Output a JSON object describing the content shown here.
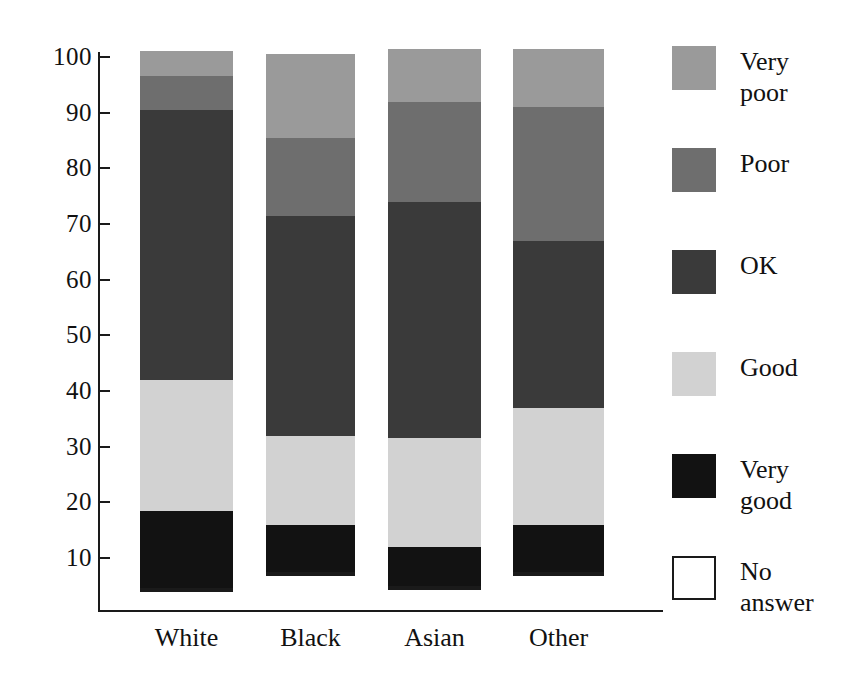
{
  "chart_data": {
    "type": "bar",
    "subtype": "stacked-vertical",
    "title": "",
    "subtitle": "",
    "xlabel": "",
    "ylabel": "",
    "categories": [
      "White",
      "Black",
      "Asian",
      "Other"
    ],
    "ylim": [
      0,
      105
    ],
    "yticks": [
      10,
      20,
      30,
      40,
      50,
      60,
      70,
      80,
      90,
      100
    ],
    "ytick_labels": [
      "10",
      "20",
      "30",
      "40",
      "50",
      "60",
      "70",
      "80",
      "90",
      "100"
    ],
    "grid": false,
    "legend_position": "right",
    "stack_order_bottom_to_top": [
      "No answer",
      "Very good",
      "Good",
      "OK",
      "Poor",
      "Very poor"
    ],
    "series": [
      {
        "name": "No answer",
        "color": "#ffffff",
        "outlined": true,
        "values": [
          4.7,
          7.5,
          5.0,
          7.5
        ]
      },
      {
        "name": "Very good",
        "color": "#121212",
        "outlined": false,
        "values": [
          13.8,
          8.5,
          7.0,
          8.5
        ]
      },
      {
        "name": "Good",
        "color": "#d2d2d2",
        "outlined": false,
        "values": [
          23.5,
          16.0,
          19.5,
          21.0
        ]
      },
      {
        "name": "OK",
        "color": "#3a3a3a",
        "outlined": false,
        "values": [
          48.5,
          39.5,
          42.5,
          30.0
        ]
      },
      {
        "name": "Poor",
        "color": "#6e6e6e",
        "outlined": false,
        "values": [
          6.0,
          14.0,
          18.0,
          24.0
        ]
      },
      {
        "name": "Very poor",
        "color": "#9a9a9a",
        "outlined": false,
        "values": [
          4.5,
          15.0,
          9.5,
          10.5
        ]
      }
    ],
    "cumulative_tops": {
      "White": [
        4.7,
        18.5,
        42.0,
        90.5,
        96.5,
        101.0
      ],
      "Black": [
        7.5,
        16.0,
        32.0,
        71.5,
        85.5,
        100.5
      ],
      "Asian": [
        5.0,
        12.0,
        31.5,
        74.0,
        92.0,
        101.5
      ],
      "Other": [
        7.5,
        16.0,
        37.0,
        67.0,
        91.0,
        101.5
      ]
    },
    "totals": [
      101.0,
      100.5,
      101.5,
      101.5
    ]
  },
  "legend": {
    "items": [
      {
        "label": "Very poor",
        "color": "#9a9a9a",
        "outlined": false
      },
      {
        "label": "Poor",
        "color": "#6e6e6e",
        "outlined": false
      },
      {
        "label": "OK",
        "color": "#3a3a3a",
        "outlined": false
      },
      {
        "label": "Good",
        "color": "#d2d2d2",
        "outlined": false
      },
      {
        "label": "Very good",
        "color": "#121212",
        "outlined": false
      },
      {
        "label": "No answer",
        "color": "#ffffff",
        "outlined": true
      }
    ]
  },
  "axis": {
    "tick_labels": [
      "100",
      "90",
      "80",
      "70",
      "60",
      "50",
      "40",
      "30",
      "20",
      "10"
    ]
  }
}
